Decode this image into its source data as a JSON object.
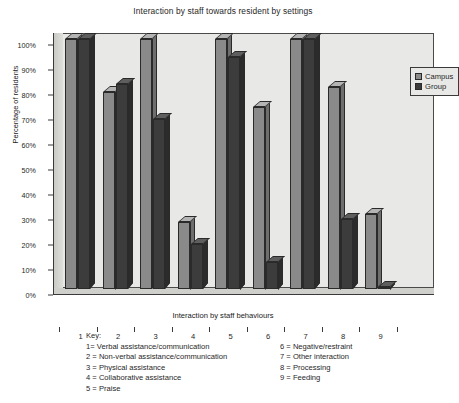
{
  "chart_data": {
    "type": "bar",
    "title": "Interaction by staff towards resident by settings",
    "xlabel": "Interaction by staff behaviours",
    "ylabel": "Percentage of residents",
    "categories": [
      "1",
      "2",
      "3",
      "4",
      "5",
      "6",
      "7",
      "8",
      "9"
    ],
    "series": [
      {
        "name": "Campus",
        "color": "#8a8a8a",
        "values": [
          100,
          79,
          100,
          27,
          100,
          73,
          100,
          81,
          30
        ]
      },
      {
        "name": "Group",
        "color": "#3c3c3c",
        "values": [
          100,
          82,
          68,
          18,
          93,
          11,
          100,
          28,
          1
        ]
      }
    ],
    "ylim": [
      0,
      100
    ],
    "yticks": [
      "0%",
      "10%",
      "20%",
      "30%",
      "40%",
      "50%",
      "60%",
      "70%",
      "80%",
      "90%",
      "100%"
    ],
    "grid": false,
    "legend_position": "top-right"
  },
  "legend": {
    "entries": [
      {
        "label": "Campus",
        "swatch": "campus"
      },
      {
        "label": "Group",
        "swatch": "group"
      }
    ]
  },
  "key": {
    "heading": "Key:",
    "left_items": [
      "1= Verbal assistance/communication",
      "2 = Non-verbal assistance/communication",
      "3 = Physical assistance",
      "4 = Collaborative assistance",
      "5 = Praise"
    ],
    "right_items": [
      "6 = Negative/restraint",
      "7 = Other interaction",
      "8 = Processing",
      "9 = Feeding"
    ]
  }
}
